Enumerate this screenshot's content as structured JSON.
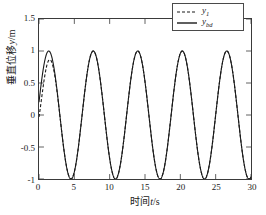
{
  "chart_data": {
    "type": "line",
    "title": "",
    "xlabel": "时间t/s",
    "xlabel_cjk": "时间",
    "xlabel_var": "t",
    "xlabel_unit": "/s",
    "ylabel": "垂直位移y/m",
    "ylabel_cjk": "垂直位移",
    "ylabel_var": "y",
    "ylabel_unit": "/m",
    "xlim": [
      0,
      30
    ],
    "ylim": [
      -1,
      1.5
    ],
    "xticks": [
      0,
      5,
      10,
      15,
      20,
      25,
      30
    ],
    "xtick_labels": [
      "0",
      "5",
      "10",
      "15",
      "20",
      "25",
      "30"
    ],
    "yticks": [
      -1,
      -0.5,
      0,
      0.5,
      1,
      1.5
    ],
    "ytick_labels": [
      "-1",
      "-0.5",
      "0",
      "0.5",
      "1",
      "1.5"
    ],
    "grid": false,
    "legend_position": "upper right",
    "series": [
      {
        "name": "y1",
        "label_base": "y",
        "label_sub": "1",
        "style": "dashed",
        "color": "#1a1a1a",
        "amplitude": 1.0,
        "period": 6.3,
        "phase": 0.2,
        "offset": 0.0
      },
      {
        "name": "ybd",
        "label_base": "y",
        "label_sub": "bd",
        "style": "solid",
        "color": "#1a1a1a",
        "amplitude": 1.0,
        "period": 6.3,
        "phase": 0.2,
        "offset": 0.0
      }
    ],
    "annotations": []
  },
  "colors": {
    "axis": "#3a3a3a",
    "curve": "#1a1a1a",
    "background": "#ffffff",
    "legend_border": "#4a4a4a"
  }
}
